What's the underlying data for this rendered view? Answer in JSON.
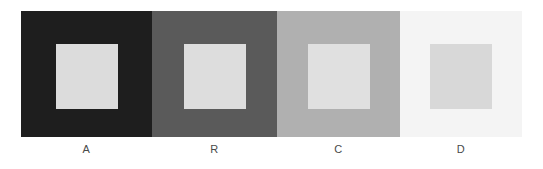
{
  "figure": {
    "type": "simultaneous-contrast-demo",
    "background_color": "#ffffff",
    "panel_count": 4,
    "strip": {
      "x": 21,
      "y": 11,
      "width": 501,
      "height": 126
    }
  },
  "panels": [
    {
      "label": "A",
      "surround_color": "#1e1e1e",
      "inner_color": "#dcdcdc",
      "inner_square": {
        "width": 62,
        "height": 65
      }
    },
    {
      "label": "R",
      "surround_color": "#5a5a5a",
      "inner_color": "#dddddd",
      "inner_square": {
        "width": 62,
        "height": 65
      }
    },
    {
      "label": "C",
      "surround_color": "#b0b0b0",
      "inner_color": "#e0e0e0",
      "inner_square": {
        "width": 62,
        "height": 65
      }
    },
    {
      "label": "D",
      "surround_color": "#f4f4f4",
      "inner_color": "#d8d8d8",
      "inner_square": {
        "width": 62,
        "height": 65
      }
    }
  ],
  "labels": {
    "text_color": "#4a4a4a",
    "font_size_px": 11
  }
}
